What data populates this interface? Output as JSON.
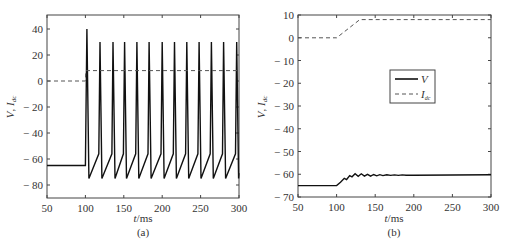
{
  "chart_data": [
    {
      "panel": "a",
      "type": "line",
      "caption": "(a)",
      "xlabel": "t/ms",
      "ylabel": "V, I_dc",
      "xlim": [
        50,
        300
      ],
      "ylim": [
        -90,
        50
      ],
      "xticks": [
        50,
        100,
        150,
        200,
        250,
        300
      ],
      "yticks": [
        40,
        20,
        0,
        -20,
        -40,
        -60,
        -80
      ],
      "ytick_labels": [
        "40",
        "20",
        "0",
        "-20",
        "-40",
        "-60",
        "-80"
      ],
      "grid": false,
      "legend": null,
      "series": [
        {
          "name": "V",
          "style": "solid",
          "description": "Resting at -65 until t=100, then tonic spiking: first spike peak 40 at t~102, subsequent spikes peak ~30 every ~15 ms, troughs ~-75",
          "resting": -65,
          "spike_times": [
            102,
            119,
            136,
            151,
            167,
            183,
            200,
            216,
            232,
            248,
            264,
            280,
            297
          ],
          "spike_peaks": [
            40,
            30,
            30,
            30,
            30,
            30,
            30,
            30,
            30,
            30,
            30,
            30,
            30
          ],
          "trough": -75,
          "pre_spike_level": -56
        },
        {
          "name": "I_dc",
          "style": "dashed",
          "x": [
            50,
            100,
            100.5,
            300
          ],
          "y": [
            0,
            0,
            8,
            8
          ]
        }
      ]
    },
    {
      "panel": "b",
      "type": "line",
      "caption": "(b)",
      "xlabel": "t/ms",
      "ylabel": "V, I_dc",
      "xlim": [
        50,
        300
      ],
      "ylim": [
        -70,
        10
      ],
      "xticks": [
        50,
        100,
        150,
        200,
        250,
        300
      ],
      "yticks": [
        10,
        0,
        -10,
        -20,
        -30,
        -40,
        -50,
        -60,
        -70
      ],
      "ytick_labels": [
        "10",
        "0",
        "-10",
        "-20",
        "-30",
        "-40",
        "-50",
        "-60",
        "-70"
      ],
      "grid": false,
      "legend": {
        "position": "center-right",
        "entries": [
          "V",
          "I_dc"
        ]
      },
      "series": [
        {
          "name": "V",
          "style": "solid",
          "x": [
            50,
            100,
            105,
            110,
            113,
            117,
            120,
            124,
            128,
            132,
            136,
            140,
            144,
            148,
            152,
            156,
            160,
            165,
            170,
            175,
            180,
            185,
            190,
            200,
            300
          ],
          "y": [
            -65,
            -65,
            -63.5,
            -61.8,
            -62.3,
            -60.6,
            -61.1,
            -59.8,
            -60.9,
            -59.8,
            -60.8,
            -60,
            -60.8,
            -60.1,
            -60.7,
            -60.2,
            -60.6,
            -60.2,
            -60.5,
            -60.3,
            -60.5,
            -60.3,
            -60.4,
            -60.4,
            -60.2
          ]
        },
        {
          "name": "I_dc",
          "style": "dashed",
          "x": [
            50,
            100,
            130,
            300
          ],
          "y": [
            0,
            0,
            8,
            8
          ]
        }
      ]
    }
  ],
  "labels": {
    "a_caption": "(a)",
    "b_caption": "(b)",
    "xlabel_t": "t",
    "xlabel_unit": "/ms",
    "ylabel_V": "V",
    "ylabel_sep": ", ",
    "ylabel_I": "I",
    "ylabel_sub": "dc",
    "legend_V": "V",
    "legend_I": "I",
    "legend_sub": "dc"
  }
}
